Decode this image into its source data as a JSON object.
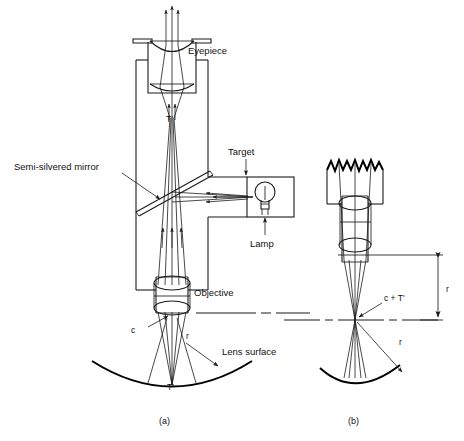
{
  "figure": {
    "panels": [
      {
        "id": "a",
        "caption": "(a)"
      },
      {
        "id": "b",
        "caption": "(b)"
      }
    ],
    "labels": {
      "eyepiece": "Eyepiece",
      "semi_silvered_mirror": "Semi-silvered mirror",
      "target": "Target",
      "lamp": "Lamp",
      "objective": "Objective",
      "lens_surface": "Lens surface",
      "t_prime_tube": "T'",
      "t_prime_surface": "T'",
      "c_marker": "c",
      "r_marker_a": "r",
      "c_plus_t_prime": "c + T'",
      "r_marker_b_vertical": "r",
      "r_marker_b_radius": "r"
    },
    "colors": {
      "background": "#ffffff",
      "stroke": "#1a1a1a",
      "heavy_stroke": "#000000",
      "text": "#111111"
    },
    "icons": {
      "lamp_bulb": "lightbulb-icon",
      "arrowhead": "arrow-icon",
      "dash_dot_axis": "optical-axis-icon"
    }
  }
}
